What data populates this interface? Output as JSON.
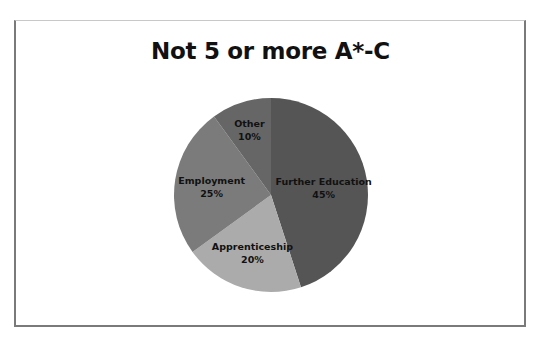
{
  "chart_data": {
    "type": "pie",
    "title": "Not 5 or more A*-C",
    "start_angle_deg": 0,
    "direction": "clockwise",
    "categories": [
      "Further Education",
      "Apprenticeship",
      "Employment",
      "Other"
    ],
    "values": [
      45,
      20,
      25,
      10
    ],
    "labels": [
      "45%",
      "20%",
      "25%",
      "10%"
    ],
    "colors": [
      "#555555",
      "#ababab",
      "#7b7b7b",
      "#666666"
    ],
    "legend": "none",
    "data_labels": "category name and percentage inside slices"
  }
}
